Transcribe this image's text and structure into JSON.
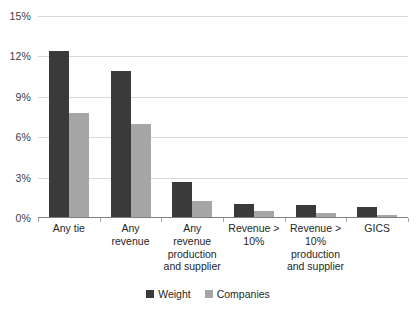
{
  "chart_data": {
    "type": "bar",
    "title": "",
    "xlabel": "",
    "ylabel": "",
    "ylim": [
      0,
      15
    ],
    "grid": true,
    "legend_position": "bottom",
    "categories": [
      "Any tie",
      "Any revenue",
      "Any revenue production and supplier",
      "Revenue > 10%",
      "Revenue > 10% production and supplier",
      "GICS"
    ],
    "category_lines": [
      [
        "Any tie"
      ],
      [
        "Any",
        "revenue"
      ],
      [
        "Any",
        "revenue",
        "production",
        "and supplier"
      ],
      [
        "Revenue >",
        "10%"
      ],
      [
        "Revenue >",
        "10%",
        "production",
        "and supplier"
      ],
      [
        "GICS"
      ]
    ],
    "ticks": [
      "0%",
      "3%",
      "6%",
      "9%",
      "12%",
      "15%"
    ],
    "tick_values": [
      0,
      3,
      6,
      9,
      12,
      15
    ],
    "series": [
      {
        "name": "Weight",
        "color": "#3a3a3a",
        "values": [
          12.4,
          10.9,
          2.7,
          1.05,
          1.0,
          0.8
        ]
      },
      {
        "name": "Companies",
        "color": "#a6a6a6",
        "values": [
          7.8,
          7.0,
          1.3,
          0.55,
          0.4,
          0.25
        ]
      }
    ]
  },
  "colors": {
    "weight": "#3a3a3a",
    "companies": "#a6a6a6",
    "gridline": "#d9d9d9",
    "axis": "#7f7f7f",
    "background": "#ffffff"
  }
}
